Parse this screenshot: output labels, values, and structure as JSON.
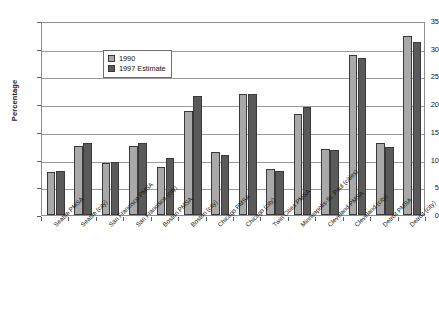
{
  "chart_data": {
    "type": "bar",
    "title": "",
    "xlabel": "",
    "ylabel": "Percentage",
    "ylim": [
      0,
      35
    ],
    "yticks": [
      0,
      5,
      10,
      15,
      20,
      25,
      30,
      35
    ],
    "grid": true,
    "legend_position": "upper-left-inside",
    "categories": [
      "Seattle PMSA",
      "Seattle (city)",
      "San Francisco PMSA",
      "San Francisco (city)",
      "Boston PMSA",
      "Boston (city)",
      "Chicago PMSA",
      "Chicago (city)",
      "Twin Cities PMSA",
      "Minneapolis-St. Paul (cities)",
      "Cleveland PMSA",
      "Cleveland (city)",
      "Detroit PMSA",
      "Detroit (city)"
    ],
    "series": [
      {
        "name": "1990",
        "color": "#a9a9a9",
        "values": [
          7.7,
          12.4,
          9.3,
          12.5,
          8.7,
          18.8,
          11.3,
          21.8,
          8.3,
          18.3,
          12.0,
          28.8,
          13.0,
          32.3
        ]
      },
      {
        "name": "1997 Estimate",
        "color": "#5a5a5a",
        "values": [
          8.0,
          13.0,
          9.5,
          13.0,
          10.3,
          21.5,
          10.9,
          21.9,
          8.0,
          19.5,
          11.8,
          28.3,
          12.3,
          31.2
        ]
      }
    ]
  },
  "legend": {
    "items": [
      {
        "label": "1990",
        "swatch": "s1"
      },
      {
        "label": "1997 Estimate",
        "swatch": "s2"
      }
    ]
  },
  "axes": {
    "y_title": "Percentage"
  }
}
